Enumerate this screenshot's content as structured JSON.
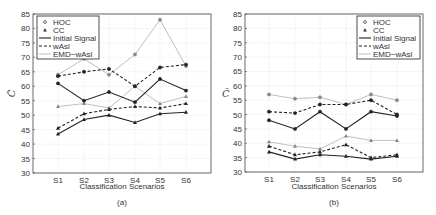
{
  "chart_data": [
    {
      "type": "line",
      "panel": "(a)",
      "caption": "(a)",
      "xlabel": "Classification Scenarios",
      "ylabel": "C̃",
      "categories": [
        "S1",
        "S2",
        "S3",
        "S4",
        "S5",
        "S6"
      ],
      "yticks": [
        30,
        35,
        40,
        45,
        50,
        55,
        60,
        65,
        70,
        75,
        80,
        85
      ],
      "ylim": [
        30,
        85
      ],
      "grid": true,
      "legend_position": "upper left",
      "legend": [
        "HOC",
        "CC",
        "Initial Signal",
        "wAsl",
        "EMD−wAsl"
      ],
      "series": [
        {
          "name": "HOC - Initial Signal",
          "marker": "circle",
          "style": "solid",
          "values": [
            61,
            55,
            58,
            54.5,
            62.5,
            58.5
          ]
        },
        {
          "name": "HOC - wAsl",
          "marker": "circle",
          "style": "dashed",
          "values": [
            63.5,
            65,
            66,
            60,
            66.5,
            67.5
          ]
        },
        {
          "name": "HOC - EMD−wAsl",
          "marker": "circle",
          "style": "dotted",
          "values": [
            64,
            69.5,
            64,
            71,
            83,
            67
          ]
        },
        {
          "name": "CC - Initial Signal",
          "marker": "triangle",
          "style": "solid",
          "values": [
            43.5,
            48.5,
            50,
            47.5,
            50.5,
            51
          ]
        },
        {
          "name": "CC - wAsl",
          "marker": "triangle",
          "style": "dashed",
          "values": [
            45.5,
            50.5,
            52,
            53,
            52.5,
            54
          ]
        },
        {
          "name": "CC - EMD−wAsl",
          "marker": "triangle",
          "style": "dotted",
          "values": [
            53,
            54,
            52.5,
            60,
            54,
            56.5
          ]
        }
      ]
    },
    {
      "type": "line",
      "panel": "(b)",
      "caption": "(b)",
      "xlabel": "Classification Scenarios",
      "ylabel": "C̃",
      "categories": [
        "S1",
        "S2",
        "S3",
        "S4",
        "S5",
        "S6"
      ],
      "yticks": [
        30,
        35,
        40,
        45,
        50,
        55,
        60,
        65,
        70,
        75,
        80,
        85
      ],
      "ylim": [
        30,
        85
      ],
      "grid": true,
      "legend_position": "upper right",
      "legend": [
        "HOC",
        "CC",
        "Initial Signal",
        "wAsl",
        "EMD−wAsl"
      ],
      "series": [
        {
          "name": "HOC - Initial Signal",
          "marker": "circle",
          "style": "solid",
          "values": [
            48,
            45,
            51,
            45,
            51,
            49.5
          ]
        },
        {
          "name": "HOC - wAsl",
          "marker": "circle",
          "style": "dashed",
          "values": [
            51,
            50.5,
            53.5,
            53.5,
            55,
            50
          ]
        },
        {
          "name": "HOC - EMD−wAsl",
          "marker": "circle",
          "style": "dotted",
          "values": [
            57,
            55.5,
            56,
            53.5,
            57,
            55
          ]
        },
        {
          "name": "CC - Initial Signal",
          "marker": "triangle",
          "style": "solid",
          "values": [
            37,
            34.5,
            36,
            35.5,
            34.5,
            35.5
          ]
        },
        {
          "name": "CC - wAsl",
          "marker": "triangle",
          "style": "dashed",
          "values": [
            39,
            36,
            37,
            39.5,
            35,
            36
          ]
        },
        {
          "name": "CC - EMD−wAsl",
          "marker": "triangle",
          "style": "dotted",
          "values": [
            40.5,
            39,
            38,
            42.5,
            41,
            41
          ]
        }
      ]
    }
  ],
  "panels": {
    "a": {
      "caption": "(a)",
      "xlabel": "Classification Scenarios",
      "ylabel": "C̃"
    },
    "b": {
      "caption": "(b)",
      "xlabel": "Classification Scenarios",
      "ylabel": "C̃"
    }
  },
  "legend_labels": {
    "hoc": "HOC",
    "cc": "CC",
    "initial": "Initial Signal",
    "wasl": "wAsl",
    "emd": "EMD−wAsl"
  }
}
